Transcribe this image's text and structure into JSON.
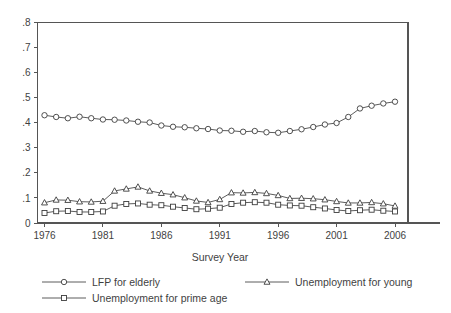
{
  "chart_data": {
    "type": "line",
    "title": "",
    "xlabel": "Survey Year",
    "ylabel": "",
    "xlim": [
      1976,
      2006
    ],
    "ylim": [
      0,
      0.8
    ],
    "grid": false,
    "legend_position": "bottom",
    "xticks": [
      "1976",
      "1981",
      "1986",
      "1991",
      "1996",
      "2001",
      "2006"
    ],
    "xtick_values": [
      1976,
      1981,
      1986,
      1991,
      1996,
      2001,
      2006
    ],
    "yticks": [
      "0",
      ".1",
      ".2",
      ".3",
      ".4",
      ".5",
      ".6",
      ".7",
      ".8"
    ],
    "ytick_values": [
      0,
      0.1,
      0.2,
      0.3,
      0.4,
      0.5,
      0.6,
      0.7,
      0.8
    ],
    "x": [
      1976,
      1977,
      1978,
      1979,
      1980,
      1981,
      1982,
      1983,
      1984,
      1985,
      1986,
      1987,
      1988,
      1989,
      1990,
      1991,
      1992,
      1993,
      1994,
      1995,
      1996,
      1997,
      1998,
      1999,
      2000,
      2001,
      2002,
      2003,
      2004,
      2005,
      2006
    ],
    "series": [
      {
        "name": "LFP for elderly",
        "marker": "circle",
        "values": [
          0.43,
          0.423,
          0.418,
          0.424,
          0.418,
          0.413,
          0.412,
          0.409,
          0.404,
          0.401,
          0.389,
          0.384,
          0.382,
          0.378,
          0.375,
          0.369,
          0.368,
          0.364,
          0.367,
          0.362,
          0.36,
          0.367,
          0.374,
          0.383,
          0.393,
          0.399,
          0.423,
          0.457,
          0.468,
          0.477,
          0.484
        ]
      },
      {
        "name": "Unemployment for young",
        "marker": "triangle",
        "values": [
          0.081,
          0.092,
          0.091,
          0.085,
          0.084,
          0.087,
          0.128,
          0.136,
          0.144,
          0.128,
          0.119,
          0.113,
          0.101,
          0.088,
          0.082,
          0.094,
          0.121,
          0.12,
          0.122,
          0.118,
          0.11,
          0.098,
          0.099,
          0.097,
          0.093,
          0.086,
          0.08,
          0.08,
          0.082,
          0.077,
          0.068
        ]
      },
      {
        "name": "Unemployment for prime age",
        "marker": "square",
        "values": [
          0.04,
          0.047,
          0.048,
          0.044,
          0.044,
          0.046,
          0.069,
          0.076,
          0.078,
          0.073,
          0.071,
          0.065,
          0.06,
          0.055,
          0.057,
          0.061,
          0.076,
          0.081,
          0.083,
          0.081,
          0.073,
          0.07,
          0.069,
          0.063,
          0.058,
          0.052,
          0.048,
          0.051,
          0.053,
          0.049,
          0.046
        ]
      }
    ]
  },
  "legend": {
    "entries": [
      {
        "label": "LFP for elderly",
        "marker": "circle-marker"
      },
      {
        "label": "Unemployment for young",
        "marker": "triangle-marker"
      },
      {
        "label": "Unemployment for prime age",
        "marker": "square-marker"
      }
    ]
  },
  "colors": {
    "line": "#4a4a4a",
    "marker_fill": "#ffffff",
    "marker_stroke": "#3d3d3d",
    "axis": "#555555",
    "text": "#3f3f3f",
    "background": "#ffffff"
  }
}
